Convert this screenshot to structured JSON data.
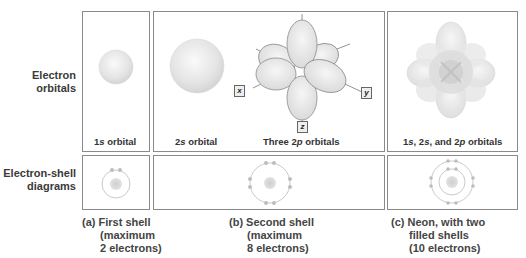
{
  "row_labels": {
    "orbitals": [
      "Electron",
      "orbitals"
    ],
    "shells": [
      "Electron-shell",
      "diagrams"
    ]
  },
  "orbital_panels": [
    {
      "id": "1s",
      "caption_parts": [
        "1",
        "s",
        " orbital"
      ]
    },
    {
      "id": "2s",
      "caption_parts": [
        "2",
        "s",
        " orbital"
      ]
    },
    {
      "id": "2p",
      "caption_parts": [
        "Three 2",
        "p",
        " orbitals"
      ]
    },
    {
      "id": "combined",
      "caption_parts": [
        "1",
        "s",
        ", 2",
        "s",
        ", and 2",
        "p",
        " orbitals"
      ]
    }
  ],
  "axis_labels": {
    "x": "x",
    "y": "y",
    "z": "z"
  },
  "shell_panels": [
    {
      "id": "a",
      "electrons": 2,
      "shells": 1
    },
    {
      "id": "b",
      "electrons": 8,
      "shells": 1
    },
    {
      "id": "c",
      "electrons": 10,
      "shells": 2
    }
  ],
  "footnotes": {
    "a": [
      "(a) First shell",
      "(maximum",
      "2 electrons)"
    ],
    "b": [
      "(b) Second shell",
      "(maximum",
      "8 electrons)"
    ],
    "c": [
      "(c) Neon, with two",
      "filled shells",
      "(10 electrons)"
    ]
  },
  "colors": {
    "border": "#8a8a8a",
    "orbital_fill": "#e6e6e6",
    "orbital_edge": "#9a9a9a",
    "nucleus": "#c8c8c8",
    "electron": "#bdbdbd"
  }
}
